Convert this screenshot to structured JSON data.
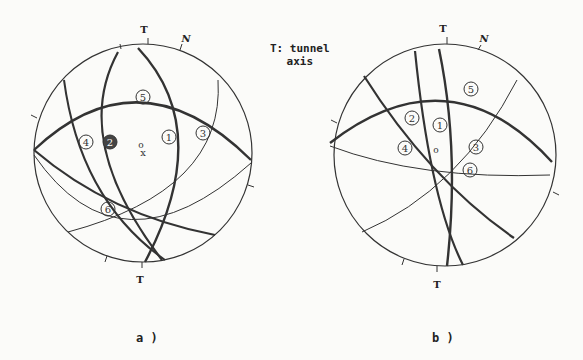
{
  "legend": {
    "line1": "T: tunnel",
    "line2": "axis"
  },
  "panels": [
    {
      "caption": "a )",
      "north_label": "N",
      "tunnel_label_top": "T",
      "tunnel_label_bottom": "T",
      "sets": [
        "1",
        "2",
        "3",
        "4",
        "5",
        "6"
      ],
      "center_marks": [
        "o",
        "x"
      ]
    },
    {
      "caption": "b )",
      "north_label": "N",
      "tunnel_label_top": "T",
      "tunnel_label_bottom": "T",
      "sets": [
        "1",
        "2",
        "3",
        "4",
        "5",
        "6"
      ],
      "center_marks": [
        "o"
      ]
    }
  ]
}
